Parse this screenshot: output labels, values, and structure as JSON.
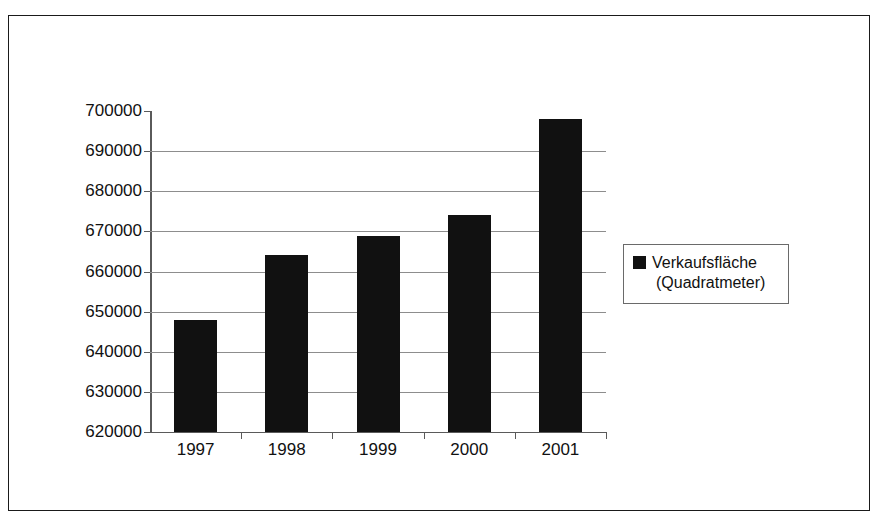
{
  "chart_data": {
    "type": "bar",
    "title": "",
    "subtitle": "",
    "xlabel": "",
    "ylabel": "",
    "categories": [
      "1997",
      "1998",
      "1999",
      "2000",
      "2001"
    ],
    "values": [
      648000,
      664000,
      668800,
      674000,
      698000
    ],
    "series": [
      {
        "name": "Verkaufsfläche (Quadratmeter)",
        "color": "#111111",
        "values": [
          648000,
          664000,
          668800,
          674000,
          698000
        ]
      }
    ],
    "ylim": [
      620000,
      700000
    ],
    "ytick_step": 10000,
    "yticks": [
      700000,
      690000,
      680000,
      670000,
      660000,
      650000,
      640000,
      630000,
      620000
    ],
    "ytick_labels": [
      "700000",
      "690000",
      "680000",
      "670000",
      "660000",
      "650000",
      "640000",
      "630000",
      "620000"
    ],
    "gridlines": [
      690000,
      680000,
      670000,
      660000,
      650000,
      640000,
      630000
    ],
    "grid": true,
    "legend": {
      "position": "right",
      "boxed": true,
      "entries": [
        {
          "label_line1": "Verkaufsfläche",
          "label_line2": "(Quadratmeter)",
          "marker": "filled-square",
          "color": "#111111"
        }
      ]
    },
    "axis_color": "#5a5a5a",
    "grid_color": "#8d8d8d",
    "background": "#ffffff"
  },
  "frame": {
    "border_color": "#1a1a1a"
  }
}
